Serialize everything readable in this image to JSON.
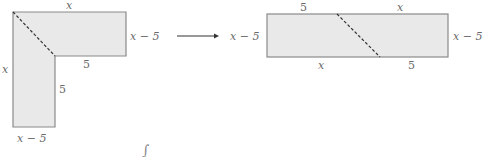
{
  "diagram": {
    "colors": {
      "fill": "#e9e9e9",
      "stroke": "#8a8a8a",
      "dash": "#333333",
      "text": "#6a6a6a"
    },
    "l_shape": {
      "labels": {
        "top": "x",
        "right": "x − 5",
        "inner_horizontal": "5",
        "left": "x",
        "inner_vertical": "5",
        "bottom": "x − 5"
      }
    },
    "arrow": {
      "direction": "right"
    },
    "rectangle": {
      "labels": {
        "top_left": "5",
        "top_right": "x",
        "left": "x − 5",
        "right": "x − 5",
        "bottom_left": "x",
        "bottom_right": "5"
      }
    },
    "mark": "∫"
  }
}
